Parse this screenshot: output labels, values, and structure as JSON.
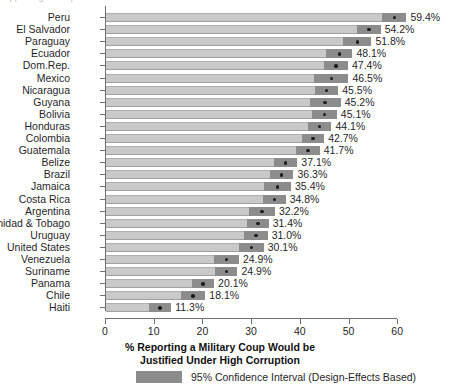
{
  "chart_data": {
    "type": "bar",
    "title": "",
    "xlabel": "% Reporting a Military Coup Would be Justified Under High Corruption",
    "xlabel_line1": "% Reporting a Military Coup Would be",
    "xlabel_line2": "Justified Under High Corruption",
    "ylabel": "",
    "xlim": [
      0,
      65
    ],
    "xticks": [
      0,
      10,
      20,
      30,
      40,
      50,
      60
    ],
    "xtick_labels": [
      "0",
      "10",
      "20",
      "30",
      "40",
      "50",
      "60"
    ],
    "grid": false,
    "orientation": "horizontal",
    "legend_position": "bottom",
    "legend": [
      {
        "label": "95% Confidence Interval (Design-Effects Based)",
        "color": "#8c8c8c"
      }
    ],
    "colors": {
      "bar": "#c9c9c9",
      "confidence_interval": "#8c8c8c",
      "point": "#1c1c1c",
      "axis": "#6e6e6e",
      "text": "#1f1f1f"
    },
    "categories": [
      "Peru",
      "El Salvador",
      "Paraguay",
      "Ecuador",
      "Dom.Rep.",
      "Mexico",
      "Nicaragua",
      "Guyana",
      "Bolivia",
      "Honduras",
      "Colombia",
      "Guatemala",
      "Belize",
      "Brazil",
      "Jamaica",
      "Costa Rica",
      "Argentina",
      "Trinidad & Tobago",
      "Uruguay",
      "United States",
      "Venezuela",
      "Suriname",
      "Panama",
      "Chile",
      "Haiti"
    ],
    "values": [
      59.4,
      54.2,
      51.8,
      48.1,
      47.4,
      46.5,
      45.5,
      45.2,
      45.1,
      44.1,
      42.7,
      41.7,
      37.1,
      36.3,
      35.4,
      34.8,
      32.2,
      31.4,
      31.0,
      30.1,
      24.9,
      24.9,
      20.1,
      18.1,
      11.3
    ],
    "value_labels": [
      "59.4%",
      "54.2%",
      "51.8%",
      "48.1%",
      "47.4%",
      "46.5%",
      "45.5%",
      "45.2%",
      "45.1%",
      "44.1%",
      "42.7%",
      "41.7%",
      "37.1%",
      "36.3%",
      "35.4%",
      "34.8%",
      "32.2%",
      "31.4%",
      "31.0%",
      "30.1%",
      "24.9%",
      "24.9%",
      "20.1%",
      "18.1%",
      "11.3%"
    ],
    "ci_low": [
      56.9,
      51.8,
      48.9,
      45.4,
      44.9,
      43.0,
      43.1,
      42.0,
      42.6,
      41.7,
      40.4,
      39.3,
      34.7,
      33.9,
      32.6,
      32.5,
      29.5,
      29.2,
      28.6,
      27.6,
      22.3,
      22.6,
      17.8,
      15.6,
      9.0
    ],
    "ci_high": [
      61.9,
      56.6,
      54.7,
      50.8,
      49.9,
      50.0,
      47.9,
      48.4,
      47.6,
      46.5,
      45.0,
      44.1,
      39.5,
      38.7,
      38.2,
      37.1,
      34.9,
      33.6,
      33.4,
      32.6,
      27.5,
      27.2,
      22.4,
      20.6,
      13.6
    ],
    "rows": [
      {
        "country": "Peru",
        "value": 59.4,
        "label": "59.4%",
        "ci_low": 56.9,
        "ci_high": 61.9
      },
      {
        "country": "El Salvador",
        "value": 54.2,
        "label": "54.2%",
        "ci_low": 51.8,
        "ci_high": 56.6
      },
      {
        "country": "Paraguay",
        "value": 51.8,
        "label": "51.8%",
        "ci_low": 48.9,
        "ci_high": 54.7
      },
      {
        "country": "Ecuador",
        "value": 48.1,
        "label": "48.1%",
        "ci_low": 45.4,
        "ci_high": 50.8
      },
      {
        "country": "Dom.Rep.",
        "value": 47.4,
        "label": "47.4%",
        "ci_low": 44.9,
        "ci_high": 49.9
      },
      {
        "country": "Mexico",
        "value": 46.5,
        "label": "46.5%",
        "ci_low": 43.0,
        "ci_high": 50.0
      },
      {
        "country": "Nicaragua",
        "value": 45.5,
        "label": "45.5%",
        "ci_low": 43.1,
        "ci_high": 47.9
      },
      {
        "country": "Guyana",
        "value": 45.2,
        "label": "45.2%",
        "ci_low": 42.0,
        "ci_high": 48.4
      },
      {
        "country": "Bolivia",
        "value": 45.1,
        "label": "45.1%",
        "ci_low": 42.6,
        "ci_high": 47.6
      },
      {
        "country": "Honduras",
        "value": 44.1,
        "label": "44.1%",
        "ci_low": 41.7,
        "ci_high": 46.5
      },
      {
        "country": "Colombia",
        "value": 42.7,
        "label": "42.7%",
        "ci_low": 40.4,
        "ci_high": 45.0
      },
      {
        "country": "Guatemala",
        "value": 41.7,
        "label": "41.7%",
        "ci_low": 39.3,
        "ci_high": 44.1
      },
      {
        "country": "Belize",
        "value": 37.1,
        "label": "37.1%",
        "ci_low": 34.7,
        "ci_high": 39.5
      },
      {
        "country": "Brazil",
        "value": 36.3,
        "label": "36.3%",
        "ci_low": 33.9,
        "ci_high": 38.7
      },
      {
        "country": "Jamaica",
        "value": 35.4,
        "label": "35.4%",
        "ci_low": 32.6,
        "ci_high": 38.2
      },
      {
        "country": "Costa Rica",
        "value": 34.8,
        "label": "34.8%",
        "ci_low": 32.5,
        "ci_high": 37.1
      },
      {
        "country": "Argentina",
        "value": 32.2,
        "label": "32.2%",
        "ci_low": 29.5,
        "ci_high": 34.9
      },
      {
        "country": "Trinidad & Tobago",
        "value": 31.4,
        "label": "31.4%",
        "ci_low": 29.2,
        "ci_high": 33.6
      },
      {
        "country": "Uruguay",
        "value": 31.0,
        "label": "31.0%",
        "ci_low": 28.6,
        "ci_high": 33.4
      },
      {
        "country": "United States",
        "value": 30.1,
        "label": "30.1%",
        "ci_low": 27.6,
        "ci_high": 32.6
      },
      {
        "country": "Venezuela",
        "value": 24.9,
        "label": "24.9%",
        "ci_low": 22.3,
        "ci_high": 27.5
      },
      {
        "country": "Suriname",
        "value": 24.9,
        "label": "24.9%",
        "ci_low": 22.6,
        "ci_high": 27.2
      },
      {
        "country": "Panama",
        "value": 20.1,
        "label": "20.1%",
        "ci_low": 17.8,
        "ci_high": 22.4
      },
      {
        "country": "Chile",
        "value": 18.1,
        "label": "18.1%",
        "ci_low": 15.6,
        "ci_high": 20.6
      },
      {
        "country": "Haiti",
        "value": 11.3,
        "label": "11.3%",
        "ci_low": 9.0,
        "ci_high": 13.6
      }
    ]
  },
  "legend": {
    "ci_label": "95% Confidence Interval (Design-Effects Based)"
  },
  "axis": {
    "title_line1": "% Reporting a Military Coup Would be",
    "title_line2": "Justified Under High Corruption"
  },
  "top_artifact": {
    "text": "clipped figure caption"
  }
}
